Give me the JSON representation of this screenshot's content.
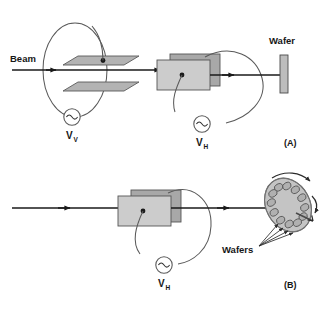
{
  "figure": {
    "type": "technical-diagram",
    "background_color": "#ffffff",
    "line_color": "#1a1a1a",
    "wire_color": "#5a5a5a"
  },
  "colors": {
    "plate_fill": "#b3b3b3",
    "plate_stroke": "#5a5a5a",
    "magnet_front_fill": "#cccccc",
    "magnet_back_fill": "#a8a8a8",
    "magnet_stroke": "#555555",
    "wafer_fill": "#bdbdbd",
    "wafer_stroke": "#4a4a4a",
    "disk_fill": "#c4c4c4",
    "disk_stroke": "#4a4a4a",
    "beam_color": "#1a1a1a",
    "source_stroke": "#5a5a5a"
  },
  "panel_a": {
    "id": "(A)",
    "beam_label": "Beam",
    "wafer_label": "Wafer",
    "vertical_source": {
      "symbol": "~",
      "label": "V",
      "subscript": "V"
    },
    "horizontal_source": {
      "symbol": "~",
      "label": "V",
      "subscript": "H"
    },
    "components": [
      "beam-line",
      "vertical-deflection-plates",
      "vertical-deflection-wire-loop",
      "scan-magnet",
      "horizontal-deflection-wire-loop",
      "target-wafer"
    ],
    "plate_count": 2,
    "beam_arrow_count": 2
  },
  "panel_b": {
    "id": "(B)",
    "wafers_label": "Wafers",
    "horizontal_source": {
      "symbol": "~",
      "label": "V",
      "subscript": "H"
    },
    "components": [
      "beam-line",
      "scan-magnet",
      "horizontal-deflection-wire-loop",
      "rotating-wafer-disk",
      "rotation-arrows"
    ],
    "wafer_count_on_disk": 12,
    "beam_arrow_count": 2,
    "leader_line_count": 4
  }
}
